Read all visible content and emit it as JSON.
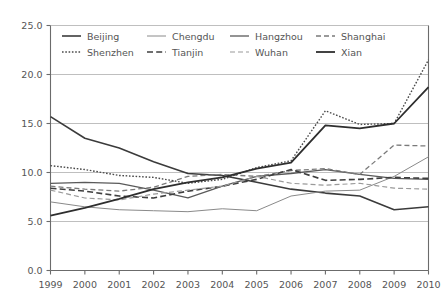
{
  "chart_data": {
    "type": "line",
    "title": "",
    "subtitle": "",
    "xlabel": "",
    "ylabel": "",
    "xlim": [
      1999,
      2010
    ],
    "ylim": [
      0.0,
      25.0
    ],
    "yticks": [
      "0.0",
      "5.0",
      "10.0",
      "15.0",
      "20.0",
      "25.0"
    ],
    "ytick_values": [
      0.0,
      5.0,
      10.0,
      15.0,
      20.0,
      25.0
    ],
    "grid": "horizontal",
    "legend_position": "top-inside",
    "categories": [
      1999,
      2000,
      2001,
      2002,
      2003,
      2004,
      2005,
      2006,
      2007,
      2008,
      2009,
      2010
    ],
    "xtick_labels": [
      "1999",
      "2000",
      "2001",
      "2002",
      "2003",
      "2004",
      "2005",
      "2006",
      "2007",
      "2008",
      "2009",
      "2010"
    ],
    "series": [
      {
        "name": "Beijing",
        "style": "solid",
        "color": "#3b3b3b",
        "width": 1.6,
        "values": [
          15.7,
          13.5,
          12.5,
          11.1,
          9.9,
          9.7,
          9.0,
          8.3,
          7.9,
          7.6,
          6.2,
          6.5
        ]
      },
      {
        "name": "Chengdu",
        "style": "solid",
        "color": "#8a8a8a",
        "width": 1.0,
        "values": [
          7.0,
          6.5,
          6.2,
          6.1,
          6.0,
          6.3,
          6.1,
          7.6,
          8.1,
          8.2,
          9.6,
          11.6
        ]
      },
      {
        "name": "Hangzhou",
        "style": "solid",
        "color": "#5a5a5a",
        "width": 1.3,
        "values": [
          8.9,
          9.0,
          8.9,
          8.2,
          7.4,
          8.6,
          9.6,
          9.9,
          10.3,
          9.8,
          9.4,
          9.3
        ]
      },
      {
        "name": "Shanghai",
        "style": "dashed",
        "color": "#7a7a7a",
        "width": 1.3,
        "values": [
          8.6,
          8.3,
          8.1,
          8.5,
          9.6,
          9.8,
          9.6,
          10.2,
          10.4,
          9.8,
          12.8,
          12.7
        ]
      },
      {
        "name": "Shenzhen",
        "style": "dotted",
        "color": "#4a4a4a",
        "width": 1.4,
        "values": [
          10.7,
          10.3,
          9.7,
          9.5,
          8.9,
          9.3,
          10.5,
          11.2,
          16.3,
          14.9,
          15.0,
          21.5
        ]
      },
      {
        "name": "Tianjin",
        "style": "dashed",
        "color": "#3f3f3f",
        "width": 1.6,
        "values": [
          8.4,
          8.1,
          7.6,
          7.4,
          8.1,
          8.6,
          9.3,
          10.3,
          9.2,
          9.3,
          9.5,
          9.4
        ]
      },
      {
        "name": "Wuhan",
        "style": "dashed",
        "color": "#9a9a9a",
        "width": 1.2,
        "values": [
          8.2,
          7.4,
          7.2,
          7.8,
          8.2,
          8.6,
          9.6,
          8.9,
          8.7,
          8.9,
          8.4,
          8.3
        ]
      },
      {
        "name": "Xian",
        "style": "solid",
        "color": "#2e2e2e",
        "width": 1.8,
        "values": [
          5.6,
          6.4,
          7.3,
          8.3,
          9.0,
          9.5,
          10.4,
          11.0,
          14.8,
          14.5,
          15.0,
          18.7
        ]
      }
    ],
    "legend_rows": [
      [
        "Beijing",
        "Chengdu",
        "Hangzhou",
        "Shanghai"
      ],
      [
        "Shenzhen",
        "Tianjin",
        "Wuhan",
        "Xian"
      ]
    ]
  },
  "axis": {
    "y_tick_labels": [
      "25.0",
      "20.0",
      "15.0",
      "10.0",
      "5.0",
      "0.0"
    ],
    "x_tick_labels": [
      "1999",
      "2000",
      "2001",
      "2002",
      "2003",
      "2004",
      "2005",
      "2006",
      "2007",
      "2008",
      "2009",
      "2010"
    ]
  },
  "legend": {
    "items": [
      {
        "label": "Beijing"
      },
      {
        "label": "Chengdu"
      },
      {
        "label": "Hangzhou"
      },
      {
        "label": "Shanghai"
      },
      {
        "label": "Shenzhen"
      },
      {
        "label": "Tianjin"
      },
      {
        "label": "Wuhan"
      },
      {
        "label": "Xian"
      }
    ]
  },
  "colors": {
    "grid": "#b8b8b8",
    "axis": "#6b6b6b",
    "text": "#555555",
    "background": "#ffffff"
  }
}
